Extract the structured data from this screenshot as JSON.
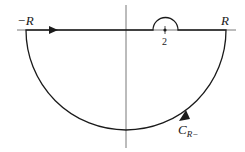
{
  "diagram": {
    "labels": {
      "neg_r": "−R",
      "pos_r": "R",
      "point": "2",
      "contour_main": "C",
      "contour_sub": "R−"
    },
    "colors": {
      "stroke": "#1a1a1a",
      "axis": "#555555",
      "background": "#ffffff"
    }
  }
}
